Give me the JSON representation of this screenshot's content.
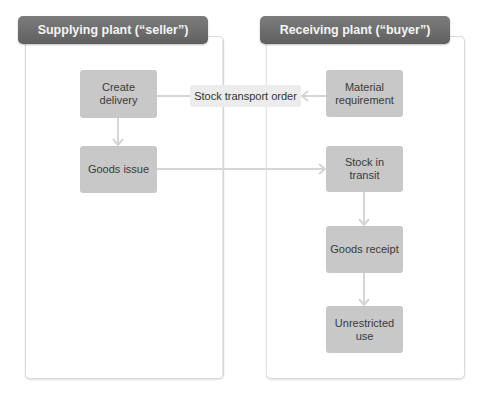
{
  "diagram": {
    "lanes": [
      {
        "id": "seller",
        "title": "Supplying plant (“seller”)"
      },
      {
        "id": "buyer",
        "title": "Receiving plant (“buyer”)"
      }
    ],
    "nodes": {
      "create_delivery": "Create delivery",
      "goods_issue": "Goods issue",
      "stock_transport_order": "Stock transport order",
      "material_requirement": "Material requirement",
      "stock_in_transit": "Stock in transit",
      "goods_receipt": "Goods receipt",
      "unrestricted_use": "Unrestricted use"
    },
    "edges": [
      {
        "from": "material_requirement",
        "to": "stock_transport_order"
      },
      {
        "from": "stock_transport_order",
        "to": "create_delivery"
      },
      {
        "from": "create_delivery",
        "to": "goods_issue"
      },
      {
        "from": "goods_issue",
        "to": "stock_in_transit"
      },
      {
        "from": "stock_in_transit",
        "to": "goods_receipt"
      },
      {
        "from": "goods_receipt",
        "to": "unrestricted_use"
      }
    ],
    "colors": {
      "header": "#6e6e6e",
      "node": "#c8c8c8",
      "node_light": "#ececec",
      "connector": "#d6d6d6"
    }
  }
}
